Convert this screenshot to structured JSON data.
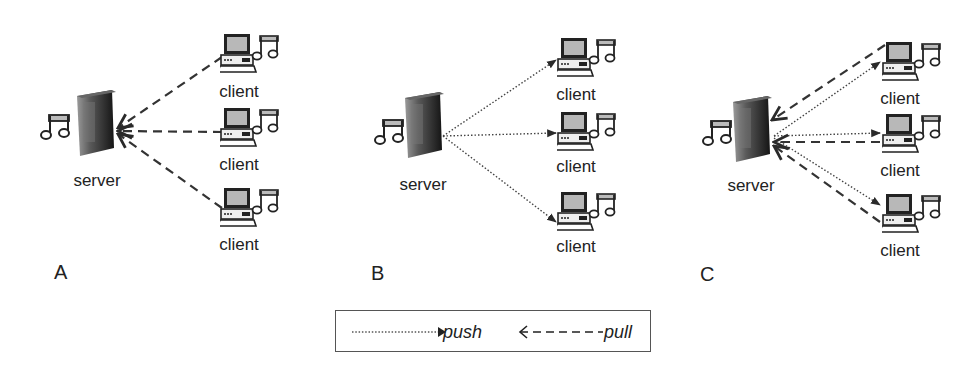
{
  "diagram": {
    "panels": [
      {
        "letter": "A",
        "mode": "pull",
        "server_label": "server",
        "client_labels": [
          "client",
          "client",
          "client"
        ]
      },
      {
        "letter": "B",
        "mode": "push",
        "server_label": "server",
        "client_labels": [
          "client",
          "client",
          "client"
        ]
      },
      {
        "letter": "C",
        "mode": "push-and-pull",
        "server_label": "server",
        "client_labels": [
          "client",
          "client",
          "client"
        ]
      }
    ],
    "legend": {
      "push_label": "push",
      "pull_label": "pull",
      "push_style": "dotted line with arrow toward client",
      "pull_style": "dashed line with arrow toward server"
    },
    "icons": {
      "server": "server-tower-icon",
      "client": "desktop-computer-icon",
      "music": "music-note-icon"
    },
    "colors": {
      "line": "#3a3a3a",
      "server_dark": "#1e1e1e",
      "server_light": "#8a8a8a",
      "monitor_screen": "#b8b8b8",
      "border": "#555555"
    }
  }
}
